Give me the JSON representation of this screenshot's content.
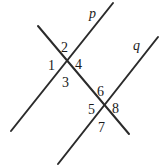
{
  "figure": {
    "type": "geometry-diagram",
    "background_color": "#ffffff",
    "stroke_color": "#2b2b2b",
    "stroke_width": 2,
    "text_color": "#1a1a1a",
    "width": 165,
    "height": 166
  },
  "lines": [
    {
      "id": "line-p",
      "label": "p",
      "label_x": 89,
      "label_y": 7,
      "x1": 11,
      "y1": 131,
      "x2": 113,
      "y2": 3
    },
    {
      "id": "line-q",
      "label": "q",
      "label_x": 133,
      "label_y": 39,
      "x1": 58,
      "y1": 164,
      "x2": 158,
      "y2": 37
    },
    {
      "id": "transversal",
      "label": "",
      "label_x": 0,
      "label_y": 0,
      "x1": 38,
      "y1": 26,
      "x2": 129,
      "y2": 134
    }
  ],
  "intersections": [
    {
      "id": "intersection-p",
      "x": 65,
      "y": 63
    },
    {
      "id": "intersection-q",
      "x": 105,
      "y": 107
    }
  ],
  "angle_labels": [
    {
      "id": "angle-1",
      "text": "1",
      "x": 48,
      "y": 59
    },
    {
      "id": "angle-2",
      "text": "2",
      "x": 61,
      "y": 41
    },
    {
      "id": "angle-3",
      "text": "3",
      "x": 62,
      "y": 76
    },
    {
      "id": "angle-4",
      "text": "4",
      "x": 75,
      "y": 58
    },
    {
      "id": "angle-5",
      "text": "5",
      "x": 88,
      "y": 103
    },
    {
      "id": "angle-6",
      "text": "6",
      "x": 97,
      "y": 85
    },
    {
      "id": "angle-7",
      "text": "7",
      "x": 98,
      "y": 121
    },
    {
      "id": "angle-8",
      "text": "8",
      "x": 112,
      "y": 102
    }
  ]
}
